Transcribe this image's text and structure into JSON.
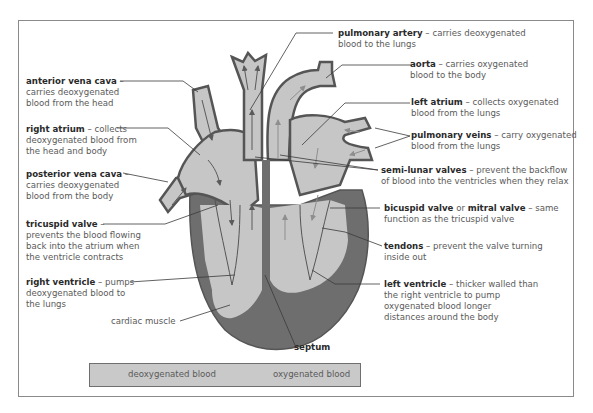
{
  "diagram": {
    "colors": {
      "deoxygenated_arrow": "#5a5a5a",
      "oxygenated_arrow": "#8e8e8e",
      "chamber_fill": "#c6c6c6",
      "muscle_fill": "#6e6e6e",
      "outline": "#555555",
      "legend_bg": "#c9c9c9"
    },
    "labels": {
      "anterior_vena_cava": {
        "term": "anterior vena cava",
        "desc_lines": [
          " –",
          "carries deoxygenated",
          "blood from the head"
        ]
      },
      "right_atrium": {
        "term": "right atrium",
        "desc_lines": [
          " – collects",
          "deoxygenated blood from",
          "the head and body"
        ]
      },
      "posterior_vena_cava": {
        "term": "posterior vena cava",
        "desc_lines": [
          " –",
          "carries deoxygenated",
          "blood from the body"
        ]
      },
      "tricuspid_valve": {
        "term": "tricuspid valve",
        "desc_lines": [
          " –",
          "prevents the blood flowing",
          "back into the atrium when",
          "the ventricle contracts"
        ]
      },
      "right_ventricle": {
        "term": "right ventricle",
        "desc_lines": [
          " – pumps",
          "deoxygenated blood to",
          "the lungs"
        ]
      },
      "cardiac_muscle": {
        "text": "cardiac muscle"
      },
      "septum": {
        "term": "septum"
      },
      "pulmonary_artery": {
        "term": "pulmonary artery",
        "desc_lines": [
          " – carries deoxygenated",
          "blood to the lungs"
        ]
      },
      "aorta": {
        "term": "aorta",
        "desc_lines": [
          " – carries oxygenated",
          "blood to the body"
        ]
      },
      "left_atrium": {
        "term": "left atrium",
        "desc_lines": [
          " – collects oxygenated",
          "blood from the lungs"
        ]
      },
      "pulmonary_veins": {
        "term": "pulmonary veins",
        "desc_lines": [
          " – carry oxygenated",
          "blood from the lungs"
        ]
      },
      "semi_lunar_valves": {
        "term": "semi-lunar valves",
        "desc_lines": [
          " – prevent the backflow",
          "of blood into the ventricles when they relax"
        ]
      },
      "bicuspid_valve": {
        "term": "bicuspid valve",
        "mid": " or ",
        "term2": "mitral valve",
        "desc_lines": [
          " – same",
          "function as the tricuspid valve"
        ]
      },
      "tendons": {
        "term": "tendons",
        "desc_lines": [
          " – prevent the valve turning",
          "inside out"
        ]
      },
      "left_ventricle": {
        "term": "left ventricle",
        "desc_lines": [
          " – thicker walled than",
          "the right ventricle to pump",
          "oxygenated blood longer",
          "distances around the body"
        ]
      }
    },
    "legend": {
      "deoxygenated": "deoxygenated blood",
      "oxygenated": "oxygenated blood"
    }
  }
}
